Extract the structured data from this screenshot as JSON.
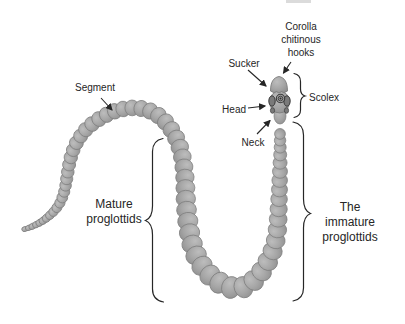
{
  "labels": {
    "segment": "Segment",
    "sucker": "Sucker",
    "corolla": "Corolla\nchitinous\nhooks",
    "head": "Head",
    "neck": "Neck",
    "scolex": "Scolex",
    "mature": "Mature\nproglottids",
    "immature": "The immature\nproglottids"
  },
  "colors": {
    "background": "#ffffff",
    "annotation": "#262626",
    "worm_highlight": "#bdbdbd",
    "worm_fill": "#a6a6a6",
    "worm_shadow": "#8f8f8f",
    "worm_outline": "#7e7e7e",
    "sucker_fill": "#7a7a7a",
    "sucker_ring": "#3c3c3c"
  }
}
